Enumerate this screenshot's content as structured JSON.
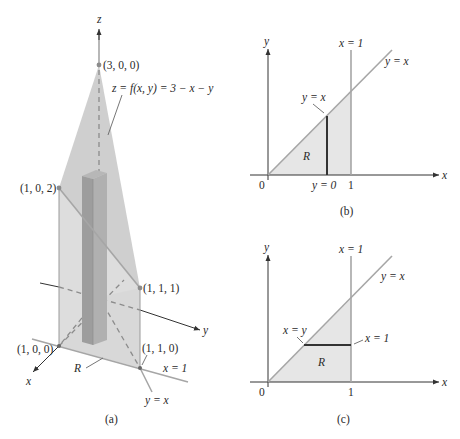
{
  "figure": {
    "panels": [
      {
        "id": "a",
        "caption": "(a)",
        "axes": {
          "x": "x",
          "y": "y",
          "z": "z"
        },
        "surface_label": "z = f(x, y) = 3 − x − y",
        "points": [
          {
            "label": "(3, 0, 0)"
          },
          {
            "label": "(1, 0, 2)"
          },
          {
            "label": "(1, 1, 1)"
          },
          {
            "label": "(1, 0, 0)"
          },
          {
            "label": "(1, 1, 0)"
          }
        ],
        "region_label": "R",
        "line_labels": {
          "x_eq_1": "x = 1",
          "y_eq_x": "y = x"
        }
      },
      {
        "id": "b",
        "caption": "(b)",
        "axes": {
          "x": "x",
          "y": "y"
        },
        "origin": "0",
        "tick_1": "1",
        "line_labels": {
          "top_x_eq_1": "x = 1",
          "diag": "y = x",
          "upper_bound": "y = x",
          "lower_bound": "y = 0"
        },
        "region_label": "R"
      },
      {
        "id": "c",
        "caption": "(c)",
        "axes": {
          "x": "x",
          "y": "y"
        },
        "origin": "0",
        "tick_1": "1",
        "line_labels": {
          "top_x_eq_1": "x = 1",
          "diag": "y = x",
          "left_bound": "x = y",
          "right_bound": "x = 1"
        },
        "region_label": "R"
      }
    ],
    "colors": {
      "plane_fill": "#c9c9c9",
      "region_fill": "#e6e6e6",
      "box_fill": "#a9a9a9",
      "line_gray": "#a6a6a6",
      "axis": "#333333"
    }
  }
}
